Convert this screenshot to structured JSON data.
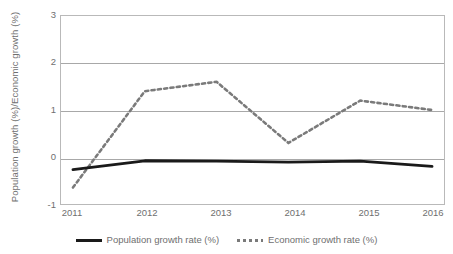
{
  "chart_data": {
    "type": "line",
    "title": "",
    "xlabel": "",
    "ylabel": "Population growth (%)/Economic growth (%)",
    "categories": [
      "2011",
      "2012",
      "2013",
      "2014",
      "2015",
      "2016"
    ],
    "x": [
      2011,
      2012,
      2013,
      2014,
      2015,
      2016
    ],
    "xlim": [
      2011,
      2016
    ],
    "ylim": [
      -1,
      3
    ],
    "yticks": [
      "-1",
      "0",
      "1",
      "2",
      "3"
    ],
    "ytick_values": [
      -1,
      0,
      1,
      2,
      3
    ],
    "grid": "horizontal",
    "legend_position": "bottom-center",
    "series": [
      {
        "name": "Population growth rate (%)",
        "style": "solid",
        "color": "#1a1a1a",
        "values": [
          -0.27,
          -0.08,
          -0.09,
          -0.11,
          -0.09,
          -0.2
        ]
      },
      {
        "name": "Economic growth rate (%)",
        "style": "dotted",
        "color": "#7a7a7a",
        "values": [
          -0.65,
          1.4,
          1.6,
          0.3,
          1.2,
          1.0
        ]
      }
    ]
  },
  "axes": {
    "y_title": "Population growth (%)/Economic growth (%)",
    "y_tick_labels": [
      "3",
      "2",
      "1",
      "0",
      "-1"
    ],
    "x_tick_labels": [
      "2011",
      "2012",
      "2013",
      "2014",
      "2015",
      "2016"
    ]
  },
  "legend": {
    "entries": [
      {
        "label": "Population growth rate (%)",
        "marker": "solid-line-swatch"
      },
      {
        "label": "Economic growth rate (%)",
        "marker": "dotted-line-swatch"
      }
    ]
  },
  "colors": {
    "population_line": "#1a1a1a",
    "economic_line": "#7a7a7a",
    "gridline": "#a8a8a8",
    "axis_border": "#b9b9b9",
    "text": "#6f6f6f",
    "background": "#ffffff"
  }
}
